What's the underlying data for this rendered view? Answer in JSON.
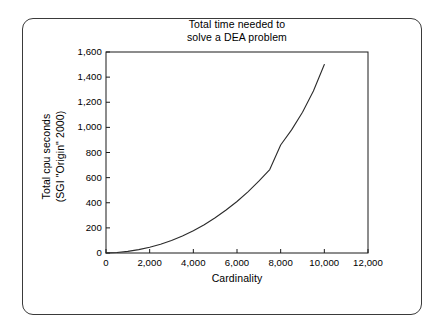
{
  "figure": {
    "background_color": "#ffffff",
    "frame_color": "#3a3a3a",
    "axis_color": "#1a1a1a",
    "curve_color": "#2b2b2b"
  },
  "chart_data": {
    "type": "line",
    "title": "Total time needed to\nsolve a DEA problem",
    "xlabel": "Cardinality",
    "ylabel": "Total cpu seconds\n(SGI \"Origin\" 2000)",
    "ylabel_line1": "Total cpu seconds",
    "ylabel_line2": "(SGI \"Origin\" 2000)",
    "grid": false,
    "legend": null,
    "xlim": [
      0,
      12000
    ],
    "ylim": [
      0,
      1600
    ],
    "xticks": [
      0,
      2000,
      4000,
      6000,
      8000,
      10000,
      12000
    ],
    "xtick_labels": [
      "0",
      "2,000",
      "4,000",
      "6,000",
      "8,000",
      "10,000",
      "12,000"
    ],
    "yticks": [
      0,
      200,
      400,
      600,
      800,
      1000,
      1200,
      1400,
      1600
    ],
    "ytick_labels": [
      "0",
      "200",
      "400",
      "600",
      "800",
      "1,000",
      "1,200",
      "1,400",
      "1,600"
    ],
    "series": [
      {
        "name": "Total cpu seconds",
        "x": [
          0,
          500,
          1000,
          1500,
          2000,
          2500,
          3000,
          3500,
          4000,
          4500,
          5000,
          5500,
          6000,
          6500,
          7000,
          7500,
          8000,
          8500,
          9000,
          9500,
          10000
        ],
        "y": [
          0,
          4,
          13,
          27,
          46,
          70,
          100,
          135,
          177,
          225,
          280,
          342,
          410,
          487,
          572,
          664,
          860,
          980,
          1120,
          1290,
          1500
        ]
      }
    ]
  }
}
